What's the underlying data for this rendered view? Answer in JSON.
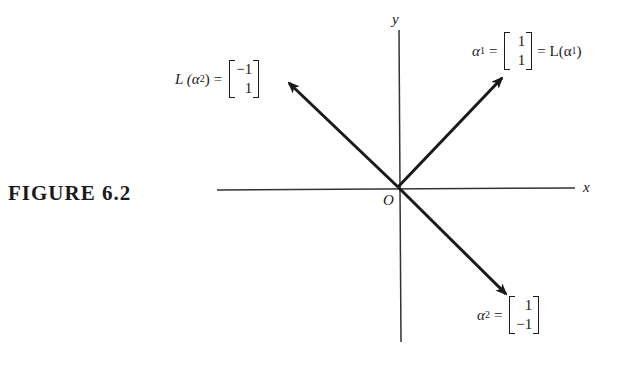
{
  "figure": {
    "caption": "FIGURE 6.2",
    "axes": {
      "x_label": "x",
      "y_label": "y",
      "origin_label": "O"
    },
    "vectors": [
      {
        "name": "alpha1",
        "label_lhs": "α",
        "sub": "1",
        "components": [
          "1",
          "1"
        ],
        "label_rhs": "= L(α",
        "rhs_sub": "1",
        "rhs_close": ")",
        "direction": [
          1,
          1
        ]
      },
      {
        "name": "alpha2",
        "label_lhs": "α",
        "sub": "2",
        "components": [
          "1",
          "−1"
        ],
        "direction": [
          1,
          -1
        ]
      },
      {
        "name": "L_alpha2",
        "label_lhs": "L (α",
        "sub": "2",
        "lhs_close": ")",
        "components": [
          "−1",
          "1"
        ],
        "direction": [
          -1,
          1
        ]
      }
    ],
    "equals": "="
  }
}
